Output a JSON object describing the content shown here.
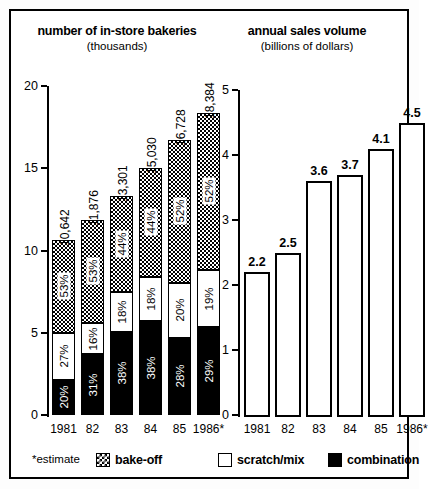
{
  "chart_data": [
    {
      "type": "bar",
      "title": "number of in-store bakeries",
      "subtitle": "(thousands)",
      "xlabel": "",
      "ylabel": "",
      "ylim": [
        0,
        20
      ],
      "yticks": [
        "0",
        "5",
        "10",
        "15",
        "20"
      ],
      "grid": false,
      "stacked": true,
      "categories": [
        "1981",
        "82",
        "83",
        "84",
        "85",
        "1986*"
      ],
      "totals": [
        "10,642",
        "11,876",
        "13,301",
        "15,030",
        "16,728",
        "18,384"
      ],
      "total_values": [
        10.642,
        11.876,
        13.301,
        15.03,
        16.728,
        18.384
      ],
      "series": [
        {
          "name": "combination",
          "pattern": "solid-black",
          "values": [
            "20%",
            "31%",
            "38%",
            "38%",
            "28%",
            "29%"
          ],
          "fractions": [
            0.2,
            0.31,
            0.38,
            0.38,
            0.28,
            0.29
          ]
        },
        {
          "name": "scratch/mix",
          "pattern": "white",
          "values": [
            "27%",
            "16%",
            "18%",
            "18%",
            "20%",
            "19%"
          ],
          "fractions": [
            0.27,
            0.16,
            0.18,
            0.18,
            0.2,
            0.19
          ]
        },
        {
          "name": "bake-off",
          "pattern": "checkered",
          "values": [
            "53%",
            "53%",
            "44%",
            "44%",
            "52%",
            "52%"
          ],
          "fractions": [
            0.53,
            0.53,
            0.44,
            0.44,
            0.52,
            0.52
          ]
        }
      ]
    },
    {
      "type": "bar",
      "title": "annual sales volume",
      "subtitle": "(billions of dollars)",
      "xlabel": "",
      "ylabel": "",
      "ylim": [
        0,
        5
      ],
      "yticks": [
        "0",
        "1",
        "2",
        "3",
        "4",
        "5"
      ],
      "grid": false,
      "stacked": false,
      "categories": [
        "1981",
        "82",
        "83",
        "84",
        "85",
        "1986*"
      ],
      "values": [
        2.2,
        2.5,
        3.6,
        3.7,
        4.1,
        4.5
      ],
      "labels": [
        "2.2",
        "2.5",
        "3.6",
        "3.7",
        "4.1",
        "4.5"
      ]
    }
  ],
  "legend": {
    "note": "*estimate",
    "items": [
      {
        "label": "bake-off",
        "pattern": "checkered"
      },
      {
        "label": "scratch/mix",
        "pattern": "white"
      },
      {
        "label": "combination",
        "pattern": "solid-black"
      }
    ]
  },
  "colors": {
    "ink": "#000000",
    "paper": "#ffffff"
  }
}
